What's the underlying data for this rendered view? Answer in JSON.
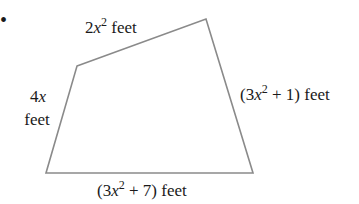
{
  "bullet": "•",
  "shape": {
    "type": "quadrilateral",
    "stroke_color": "#8a8a8a",
    "vertices": [
      [
        77,
        66
      ],
      [
        206,
        19
      ],
      [
        253,
        173
      ],
      [
        46,
        173
      ]
    ]
  },
  "sides": {
    "top": {
      "coef": "2",
      "var": "x",
      "exp": "2",
      "unit": " feet"
    },
    "left": {
      "line1_coef": "4",
      "line1_var": "x",
      "line2": "feet"
    },
    "right": {
      "open": "(3",
      "var": "x",
      "exp": "2",
      "rest": " + 1) feet"
    },
    "bottom": {
      "open": "(3",
      "var": "x",
      "exp": "2",
      "rest": " + 7) feet"
    }
  }
}
